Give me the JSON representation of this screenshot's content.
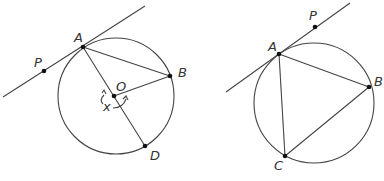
{
  "figures": [
    {
      "id": "left",
      "description": "Circle with center O, tangent line at A through P, chords AB and AD (diameter through O), radius OB, angle x at O",
      "circle": {
        "cx": 116,
        "cy": 96,
        "r": 58
      },
      "tangent": {
        "x1": 3,
        "y1": 97,
        "x2": 145,
        "y2": 6
      },
      "points": {
        "A": {
          "x": 83,
          "y": 47,
          "label": "A"
        },
        "B": {
          "x": 170,
          "y": 76,
          "label": "B"
        },
        "O": {
          "x": 114,
          "y": 96,
          "label": "O"
        },
        "D": {
          "x": 145,
          "y": 146,
          "label": "D"
        },
        "P": {
          "x": 44,
          "y": 71,
          "label": "P"
        }
      },
      "angle_label": "x"
    },
    {
      "id": "right",
      "description": "Circle with inscribed triangle ABC, tangent line at A through P",
      "circle": {
        "cx": 314,
        "cy": 103,
        "r": 60
      },
      "tangent": {
        "x1": 226,
        "y1": 92,
        "x2": 350,
        "y2": 3
      },
      "points": {
        "A": {
          "x": 279,
          "y": 54,
          "label": "A"
        },
        "B": {
          "x": 369,
          "y": 87,
          "label": "B"
        },
        "C": {
          "x": 285,
          "y": 156,
          "label": "C"
        },
        "P": {
          "x": 315,
          "y": 27,
          "label": "P"
        }
      }
    }
  ],
  "colors": {
    "line": "#444444",
    "point": "#111111",
    "text": "#333333",
    "background": "#ffffff"
  }
}
